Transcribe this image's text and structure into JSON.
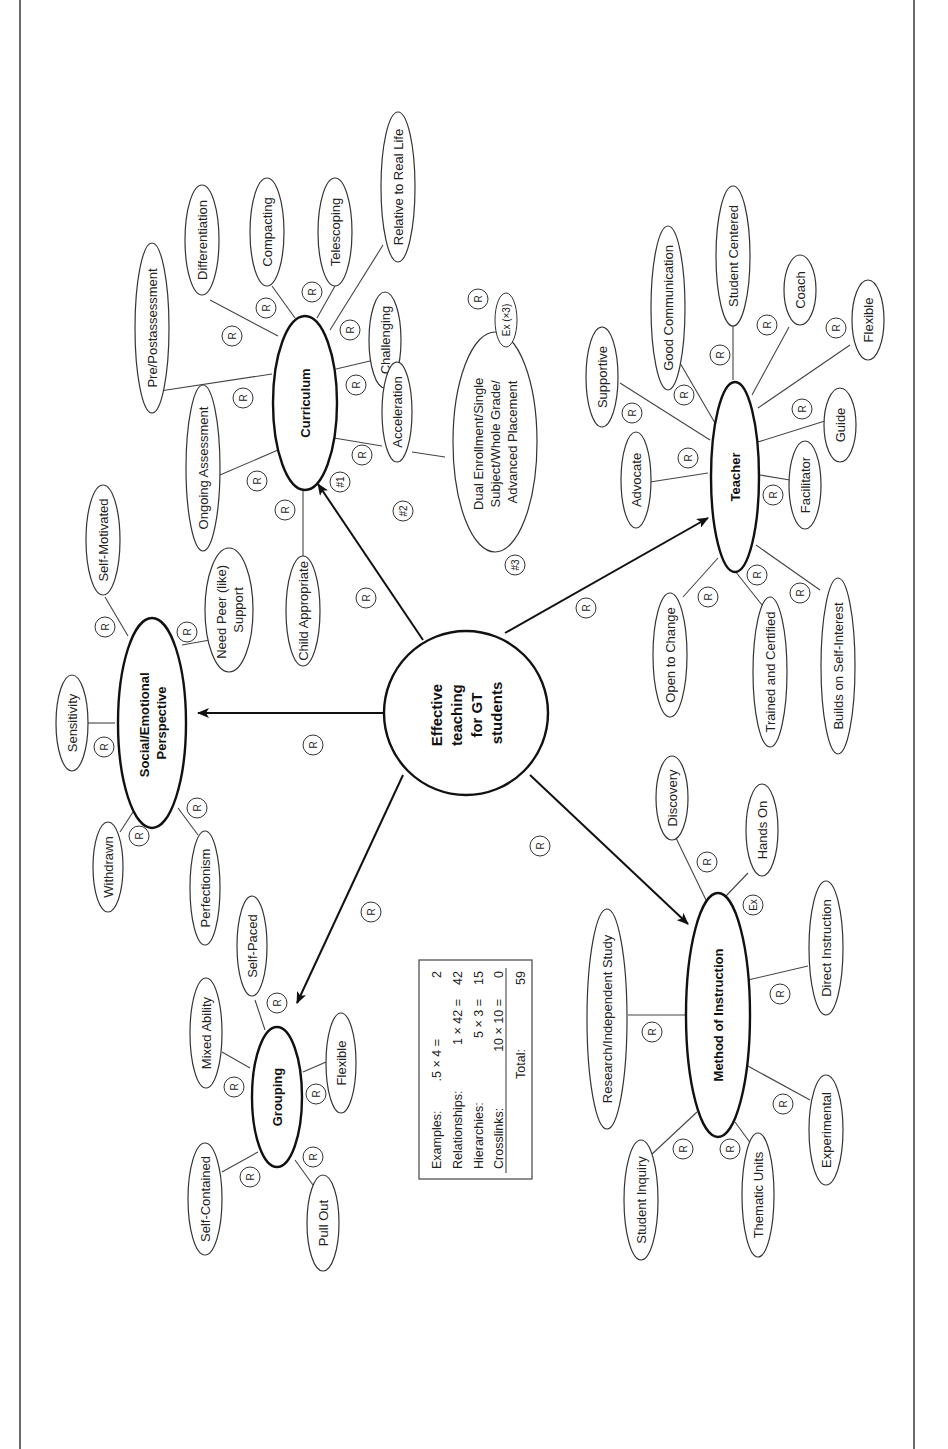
{
  "center": {
    "label_lines": [
      "Effective",
      "teaching",
      "for GT",
      "students"
    ]
  },
  "relationship_badge": "R",
  "example_badge": "Ex",
  "main_nodes": {
    "curriculum": "Curriculum",
    "social_emotional": [
      "Social/Emotional",
      "Perspective"
    ],
    "grouping": "Grouping",
    "method_of_instruction": "Method of Instruction",
    "teacher": "Teacher"
  },
  "curriculum_children": [
    "Child Appropriate",
    "Ongoing Assessment",
    "Pre/Postassessment",
    "Differentiation",
    "Compacting",
    "Telescoping",
    "Relative to Real Life",
    "Challenging",
    "Acceleration"
  ],
  "acceleration_child": [
    "Dual Enrollment/Single",
    "Subject/Whole Grade/",
    "Advanced Placement"
  ],
  "acceleration_markers": [
    "#1",
    "#2",
    "#3"
  ],
  "acceleration_example": "Ex (×3)",
  "social_emotional_children": [
    "Self-Motivated",
    "Need Peer (like)",
    "Support",
    "Sensitivity",
    "Withdrawn",
    "Perfectionism"
  ],
  "grouping_children": [
    "Self-Paced",
    "Mixed Ability",
    "Flexible",
    "Self-Contained",
    "Pull Out"
  ],
  "method_children": [
    "Discovery",
    "Hands On",
    "Research/Independent Study",
    "Direct Instruction",
    "Student Inquiry",
    "Thematic Units",
    "Experimental"
  ],
  "teacher_children": [
    "Supportive",
    "Good Communication",
    "Student Centered",
    "Coach",
    "Flexible",
    "Guide",
    "Advocate",
    "Facilitator",
    "Open to Change",
    "Trained and Certified",
    "Builds on Self-Interest"
  ],
  "score_box": {
    "rows": [
      {
        "label": "Examples:",
        "formula": ".5 × 4 =",
        "value": "2"
      },
      {
        "label": "Relationships:",
        "formula": "1 × 42 =",
        "value": "42"
      },
      {
        "label": "Hierarchies:",
        "formula": "5 × 3 =",
        "value": "15"
      },
      {
        "label": "Crosslinks:",
        "formula": "10 × 10 =",
        "value": "0"
      }
    ],
    "total_label": "Total:",
    "total_value": "59"
  }
}
